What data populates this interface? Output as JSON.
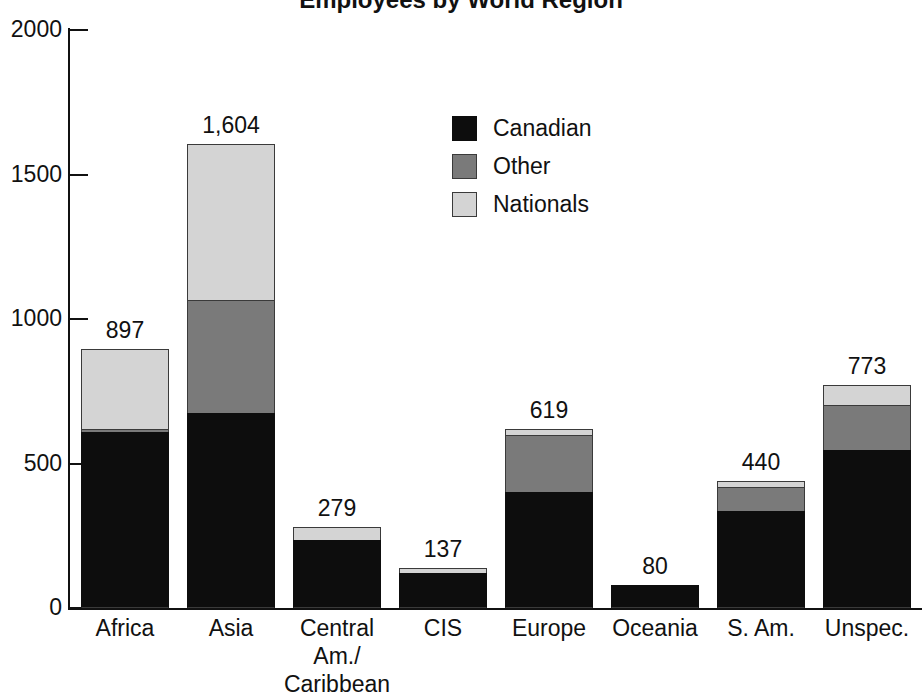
{
  "chart_data": {
    "type": "bar",
    "title": "Employees by World Region",
    "subtitle": "",
    "xlabel": "",
    "ylabel": "",
    "stacked": true,
    "grid": false,
    "legend_position": "inside-top-center",
    "ylim": [
      0,
      2000
    ],
    "yticks": [
      0,
      500,
      1000,
      1500,
      2000
    ],
    "ytick_labels": [
      "0",
      "500",
      "1000",
      "1500",
      "2000"
    ],
    "categories": [
      "Africa",
      "Asia",
      "Central Am./ Caribbean",
      "CIS",
      "Europe",
      "Oceania",
      "S. Am.",
      "Unspec."
    ],
    "category_label_lines": [
      [
        "Africa"
      ],
      [
        "Asia"
      ],
      [
        "Central",
        "Am./",
        "Caribbean"
      ],
      [
        "CIS"
      ],
      [
        "Europe"
      ],
      [
        "Oceania"
      ],
      [
        "S. Am."
      ],
      [
        "Unspec."
      ]
    ],
    "series": [
      {
        "name": "Canadian",
        "color": "#0d0d0d",
        "values": [
          608,
          675,
          235,
          120,
          400,
          80,
          335,
          546
        ]
      },
      {
        "name": "Other",
        "color": "#7a7a7a",
        "values": [
          10,
          390,
          0,
          0,
          198,
          0,
          85,
          156
        ]
      },
      {
        "name": "Nationals",
        "color": "#d4d4d4",
        "values": [
          279,
          539,
          44,
          17,
          21,
          0,
          20,
          71
        ]
      }
    ],
    "totals": [
      897,
      1604,
      279,
      137,
      619,
      80,
      440,
      773
    ],
    "total_labels": [
      "897",
      "1,604",
      "279",
      "137",
      "619",
      "80",
      "440",
      "773"
    ]
  },
  "legend": {
    "items": [
      {
        "label": "Canadian",
        "swatch": "swatch-canadian"
      },
      {
        "label": "Other",
        "swatch": "swatch-other"
      },
      {
        "label": "Nationals",
        "swatch": "swatch-nationals"
      }
    ]
  },
  "axis": {
    "y_tick_labels": [
      "2000",
      "1500",
      "1000",
      "500",
      "0"
    ]
  }
}
